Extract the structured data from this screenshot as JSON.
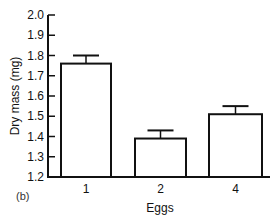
{
  "chart_data": {
    "type": "bar",
    "title": "",
    "panel_label": "(b)",
    "xlabel": "Eggs",
    "ylabel": "Dry mass (mg)",
    "categories": [
      "1",
      "2",
      "4"
    ],
    "values": [
      1.76,
      1.39,
      1.51
    ],
    "error_upper": [
      1.8,
      1.43,
      1.55
    ],
    "ylim": [
      1.2,
      2.0
    ],
    "yticks": [
      "1.2",
      "1.3",
      "1.4",
      "1.5",
      "1.6",
      "1.7",
      "1.8",
      "1.9",
      "2.0"
    ],
    "grid": false,
    "legend": null,
    "bar_fill": "#ffffff",
    "bar_stroke": "#111111"
  }
}
